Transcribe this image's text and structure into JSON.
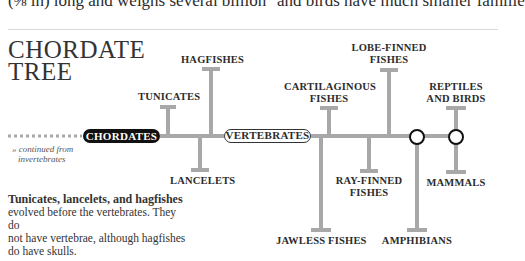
{
  "top_text": {
    "left": "(⅜ in) long and weighs several billion",
    "right": "and birds have much smaller familie"
  },
  "title": {
    "line1": "CHORDATE",
    "line2": "TREE"
  },
  "continued_note": {
    "line1": "» continued from",
    "line2": "invertebrates"
  },
  "nodes": {
    "chordates": "CHORDATES",
    "vertebrates": "VERTEBRATES"
  },
  "branches": {
    "tunicates": "TUNICATES",
    "hagfishes": "HAGFISHES",
    "lancelets": "LANCELETS",
    "cartilaginous_1": "CARTILAGINOUS",
    "cartilaginous_2": "FISHES",
    "lobe_1": "LOBE-FINNED",
    "lobe_2": "FISHES",
    "reptiles_1": "REPTILES",
    "reptiles_2": "AND BIRDS",
    "jawless": "JAWLESS FISHES",
    "ray_1": "RAY-FINNED",
    "ray_2": "FISHES",
    "amphibians": "AMPHIBIANS",
    "mammals": "MAMMALS"
  },
  "description": {
    "bold": "Tunicates, lancelets, and hagfishes",
    "line1": "evolved before the vertebrates. They do",
    "line2": "not have vertebrae, although hagfishes",
    "line3": "do have skulls."
  },
  "colors": {
    "branch": "#a8a8a8",
    "dark_pill": "#111111"
  }
}
